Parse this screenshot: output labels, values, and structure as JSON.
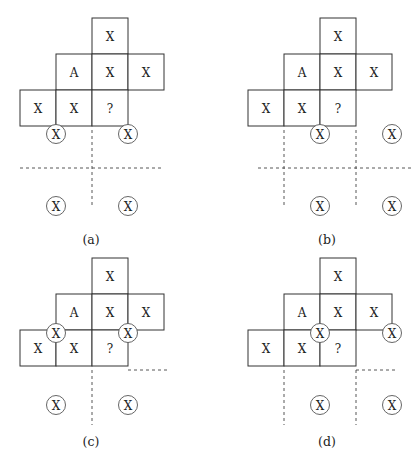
{
  "figure": {
    "cell_size": 36,
    "cell_labels": {
      "top": "X",
      "mid_left": "A",
      "mid_center": "X",
      "mid_right": "X",
      "bot_left": "X",
      "bot_center": "X",
      "bot_query": "?"
    },
    "circle_label": "X",
    "panels": [
      {
        "id": "a",
        "caption": "(a)",
        "origin": [
          20,
          18
        ],
        "caption_pos": [
          91,
          239
        ],
        "circles": [
          [
            56,
            134
          ],
          [
            128,
            134
          ],
          [
            56,
            206
          ],
          [
            128,
            206
          ]
        ],
        "dashes": [
          [
            92,
            130,
            92,
            208
          ],
          [
            20,
            168,
            164,
            168
          ]
        ]
      },
      {
        "id": "b",
        "caption": "(b)",
        "origin": [
          248,
          18
        ],
        "caption_pos": [
          327,
          239
        ],
        "circles": [
          [
            320,
            134
          ],
          [
            392,
            134
          ],
          [
            320,
            206
          ],
          [
            392,
            206
          ]
        ],
        "dashes": [
          [
            284,
            130,
            284,
            208
          ],
          [
            356,
            130,
            356,
            208
          ],
          [
            258,
            168,
            412,
            168
          ]
        ]
      },
      {
        "id": "c",
        "caption": "(c)",
        "origin": [
          20,
          258
        ],
        "caption_pos": [
          91,
          441
        ],
        "circles": [
          [
            56,
            333
          ],
          [
            128,
            333
          ],
          [
            56,
            405
          ],
          [
            128,
            405
          ]
        ],
        "dashes": [
          [
            92,
            370,
            92,
            425
          ],
          [
            128,
            370,
            168,
            370
          ]
        ]
      },
      {
        "id": "d",
        "caption": "(d)",
        "origin": [
          248,
          258
        ],
        "caption_pos": [
          327,
          441
        ],
        "circles": [
          [
            320,
            333
          ],
          [
            392,
            333
          ],
          [
            320,
            405
          ],
          [
            392,
            405
          ]
        ],
        "dashes": [
          [
            284,
            370,
            284,
            425
          ],
          [
            356,
            370,
            356,
            425
          ],
          [
            356,
            370,
            396,
            370
          ]
        ]
      }
    ]
  }
}
